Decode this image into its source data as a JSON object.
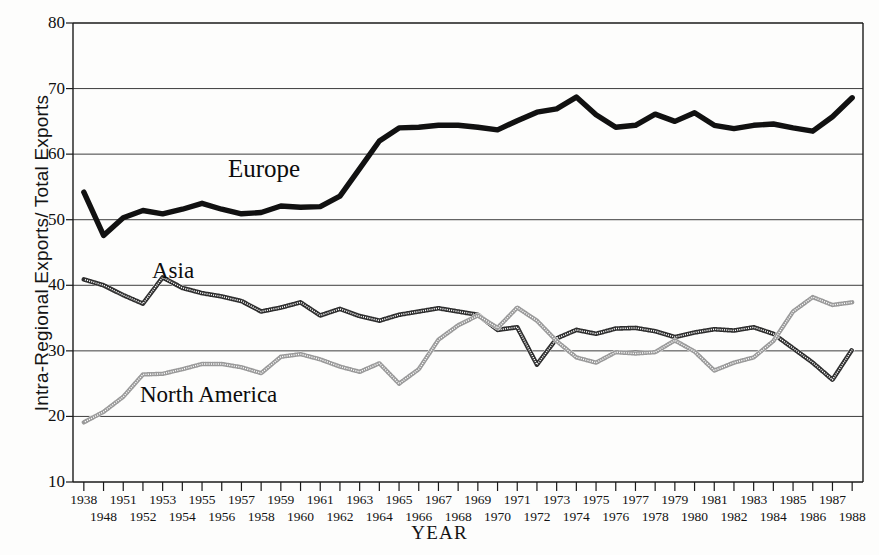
{
  "chart_data": {
    "type": "line",
    "title": "",
    "xlabel": "YEAR",
    "ylabel": "Intra-Regional Exports/ Total Exports",
    "ylim": [
      10,
      80
    ],
    "yticks": [
      10,
      20,
      30,
      40,
      50,
      60,
      70,
      80
    ],
    "grid": true,
    "legend_position": "inline-annotations",
    "x": [
      1938,
      1948,
      1951,
      1952,
      1953,
      1954,
      1955,
      1956,
      1957,
      1958,
      1959,
      1960,
      1961,
      1962,
      1963,
      1964,
      1965,
      1966,
      1967,
      1968,
      1969,
      1970,
      1971,
      1972,
      1973,
      1974,
      1975,
      1976,
      1977,
      1978,
      1979,
      1980,
      1981,
      1982,
      1983,
      1984,
      1985,
      1986,
      1987,
      1988
    ],
    "xtick_labels_row1": [
      "1938",
      "",
      "1951",
      "",
      "1953",
      "",
      "1955",
      "",
      "1957",
      "",
      "1959",
      "",
      "1961",
      "",
      "1963",
      "",
      "1965",
      "",
      "1967",
      "",
      "1969",
      "",
      "1971",
      "",
      "1973",
      "",
      "1975",
      "",
      "1977",
      "",
      "1979",
      "",
      "1981",
      "",
      "1983",
      "",
      "1985",
      "",
      "1987",
      ""
    ],
    "xtick_labels_row2": [
      "",
      "1948",
      "",
      "1952",
      "",
      "1954",
      "",
      "1956",
      "",
      "1958",
      "",
      "1960",
      "",
      "1962",
      "",
      "1964",
      "",
      "1966",
      "",
      "1968",
      "",
      "1970",
      "",
      "1972",
      "",
      "1974",
      "",
      "1976",
      "",
      "1978",
      "",
      "1980",
      "",
      "1982",
      "",
      "1984",
      "",
      "1986",
      "",
      "1988"
    ],
    "series": [
      {
        "name": "Europe",
        "style": "thick-solid",
        "color": "#111111",
        "values": [
          54.2,
          47.6,
          50.3,
          51.4,
          50.9,
          51.6,
          52.5,
          51.6,
          50.9,
          51.1,
          52.1,
          51.9,
          52.0,
          53.6,
          57.8,
          62.0,
          64.0,
          64.1,
          64.4,
          64.4,
          64.1,
          63.7,
          65.1,
          66.4,
          66.9,
          68.7,
          66.0,
          64.1,
          64.4,
          66.1,
          65.0,
          66.3,
          64.4,
          63.9,
          64.4,
          64.6,
          64.0,
          63.5,
          65.7,
          68.6
        ]
      },
      {
        "name": "Asia",
        "style": "dotted-dark",
        "color": "#3b3b3b",
        "values": [
          40.9,
          40.0,
          38.5,
          37.2,
          41.2,
          39.6,
          38.8,
          38.3,
          37.6,
          36.0,
          36.6,
          37.4,
          35.4,
          36.4,
          35.3,
          34.6,
          35.5,
          36.0,
          36.5,
          36.0,
          35.5,
          33.2,
          33.6,
          27.9,
          31.9,
          33.2,
          32.6,
          33.4,
          33.5,
          33.0,
          32.1,
          32.8,
          33.3,
          33.1,
          33.6,
          32.6,
          30.4,
          28.2,
          25.6,
          30.2
        ]
      },
      {
        "name": "North America",
        "style": "dotted-light",
        "color": "#8a8a8a",
        "values": [
          19.1,
          20.7,
          23.0,
          26.4,
          26.5,
          27.2,
          28.0,
          28.0,
          27.5,
          26.6,
          29.1,
          29.5,
          28.7,
          27.6,
          26.8,
          28.1,
          25.0,
          27.2,
          31.7,
          33.9,
          35.4,
          33.5,
          36.6,
          34.6,
          31.5,
          29.0,
          28.2,
          29.8,
          29.6,
          29.8,
          31.6,
          29.9,
          27.0,
          28.2,
          29.0,
          31.5,
          36.0,
          38.2,
          37.0,
          37.4
        ]
      }
    ],
    "annotations": [
      {
        "name": "Europe",
        "text": "Europe"
      },
      {
        "name": "Asia",
        "text": "Asia"
      },
      {
        "name": "North America",
        "text": "North America"
      }
    ]
  },
  "axis": {
    "y_title": "Intra-Regional Exports/ Total Exports",
    "x_title": "YEAR"
  },
  "colors": {
    "europe": "#111111",
    "asia": "#3b3b3b",
    "north_america": "#8a8a8a",
    "axis": "#1a1a1a",
    "grid": "#3d3d3d",
    "background": "#fdfdfc"
  }
}
